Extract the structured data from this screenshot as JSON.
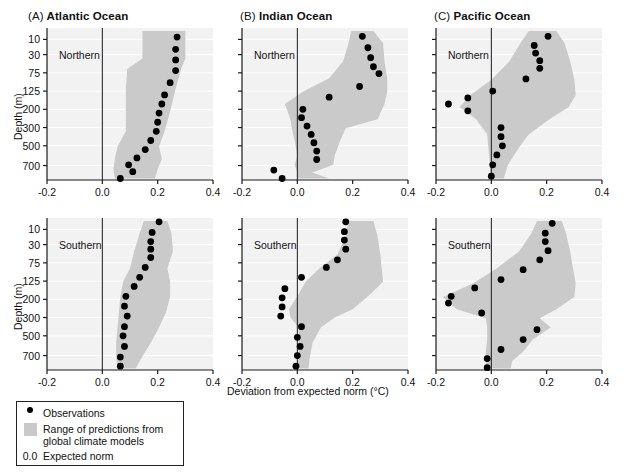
{
  "figure": {
    "xlabel": "Deviation from expected norm (°C)",
    "ylabel": "Depth (m)",
    "xticks": [
      "-0.2",
      "0.0",
      "0.2",
      "0.4"
    ],
    "xtick_values": [
      -0.2,
      0.0,
      0.2,
      0.4
    ],
    "xlim": [
      -0.2,
      0.4
    ],
    "yticks": [
      "10",
      "30",
      "75",
      "125",
      "200",
      "300",
      "500",
      "700"
    ],
    "hemispheres": [
      "Northern",
      "Southern"
    ],
    "band_color": "#cacaca",
    "point_color": "#000000",
    "axis_color": "#1a1a1a",
    "plot_bg": "#f2f2f2"
  },
  "legend": {
    "items": [
      {
        "key": "dot",
        "label": "Observations"
      },
      {
        "key": "swatch",
        "label": "Range of predictions from\nglobal climate models"
      },
      {
        "key": "0.0",
        "label": "Expected norm"
      }
    ]
  },
  "chart_data": {
    "type": "scatter",
    "title": "",
    "xlabel": "Deviation from expected norm (°C)",
    "ylabel": "Depth (m)",
    "xlim": [
      -0.2,
      0.4
    ],
    "xticks": [
      -0.2,
      0.0,
      0.2,
      0.4
    ],
    "depth_categories": [
      10,
      30,
      75,
      125,
      200,
      300,
      500,
      700
    ],
    "depth_tick_labels": [
      "10",
      "30",
      "75",
      "125",
      "200",
      "300",
      "500",
      "700"
    ],
    "grid": "horizontal-faint",
    "legend_position": "below-left",
    "reference_line": 0.0,
    "panels": [
      {
        "id": "A",
        "tag": "(A)",
        "title": "Atlantic Ocean",
        "hemisphere": "Northern",
        "observations": [
          {
            "y": 0.06,
            "x": 0.27
          },
          {
            "y": 0.14,
            "x": 0.265
          },
          {
            "y": 0.21,
            "x": 0.265
          },
          {
            "y": 0.28,
            "x": 0.265
          },
          {
            "y": 0.36,
            "x": 0.245
          },
          {
            "y": 0.44,
            "x": 0.225
          },
          {
            "y": 0.5,
            "x": 0.215
          },
          {
            "y": 0.56,
            "x": 0.205
          },
          {
            "y": 0.62,
            "x": 0.2
          },
          {
            "y": 0.68,
            "x": 0.195
          },
          {
            "y": 0.74,
            "x": 0.175
          },
          {
            "y": 0.8,
            "x": 0.155
          },
          {
            "y": 0.855,
            "x": 0.125
          },
          {
            "y": 0.9,
            "x": 0.095
          },
          {
            "y": 0.945,
            "x": 0.11
          },
          {
            "y": 0.99,
            "x": 0.065
          }
        ],
        "band": [
          {
            "y": 0.02,
            "lo": 0.145,
            "hi": 0.3
          },
          {
            "y": 0.12,
            "lo": 0.145,
            "hi": 0.3
          },
          {
            "y": 0.2,
            "lo": 0.145,
            "hi": 0.3
          },
          {
            "y": 0.27,
            "lo": 0.09,
            "hi": 0.285
          },
          {
            "y": 0.4,
            "lo": 0.085,
            "hi": 0.265
          },
          {
            "y": 0.55,
            "lo": 0.085,
            "hi": 0.245
          },
          {
            "y": 0.68,
            "lo": 0.085,
            "hi": 0.225
          },
          {
            "y": 0.78,
            "lo": 0.055,
            "hi": 0.205
          },
          {
            "y": 0.86,
            "lo": 0.045,
            "hi": 0.215
          },
          {
            "y": 0.93,
            "lo": 0.04,
            "hi": 0.2
          },
          {
            "y": 0.99,
            "lo": 0.045,
            "hi": 0.19
          }
        ]
      },
      {
        "id": "B",
        "tag": "(B)",
        "title": "Indian Ocean",
        "hemisphere": "Northern",
        "observations": [
          {
            "y": 0.055,
            "x": 0.235
          },
          {
            "y": 0.13,
            "x": 0.255
          },
          {
            "y": 0.195,
            "x": 0.265
          },
          {
            "y": 0.255,
            "x": 0.275
          },
          {
            "y": 0.3,
            "x": 0.295
          },
          {
            "y": 0.385,
            "x": 0.225
          },
          {
            "y": 0.455,
            "x": 0.115
          },
          {
            "y": 0.535,
            "x": 0.02
          },
          {
            "y": 0.59,
            "x": 0.015
          },
          {
            "y": 0.645,
            "x": 0.035
          },
          {
            "y": 0.7,
            "x": 0.05
          },
          {
            "y": 0.755,
            "x": 0.06
          },
          {
            "y": 0.81,
            "x": 0.07
          },
          {
            "y": 0.865,
            "x": 0.07
          },
          {
            "y": 0.935,
            "x": -0.085
          },
          {
            "y": 0.99,
            "x": -0.055
          }
        ],
        "band": [
          {
            "y": 0.02,
            "lo": 0.195,
            "hi": 0.275
          },
          {
            "y": 0.1,
            "lo": 0.185,
            "hi": 0.31
          },
          {
            "y": 0.22,
            "lo": 0.165,
            "hi": 0.315
          },
          {
            "y": 0.33,
            "lo": 0.115,
            "hi": 0.325
          },
          {
            "y": 0.42,
            "lo": 0.02,
            "hi": 0.325
          },
          {
            "y": 0.5,
            "lo": -0.045,
            "hi": 0.315
          },
          {
            "y": 0.6,
            "lo": -0.025,
            "hi": 0.29
          },
          {
            "y": 0.66,
            "lo": -0.02,
            "hi": 0.175
          },
          {
            "y": 0.74,
            "lo": -0.01,
            "hi": 0.155
          },
          {
            "y": 0.84,
            "lo": 0.0,
            "hi": 0.135
          },
          {
            "y": 0.9,
            "lo": -0.01,
            "hi": 0.13
          },
          {
            "y": 0.95,
            "lo": 0.0,
            "hi": 0.055
          },
          {
            "y": 0.99,
            "lo": 0.0,
            "hi": 0.115
          }
        ]
      },
      {
        "id": "C",
        "tag": "(C)",
        "title": "Pacific Ocean",
        "hemisphere": "Northern",
        "observations": [
          {
            "y": 0.055,
            "x": 0.205
          },
          {
            "y": 0.115,
            "x": 0.155
          },
          {
            "y": 0.165,
            "x": 0.16
          },
          {
            "y": 0.215,
            "x": 0.175
          },
          {
            "y": 0.265,
            "x": 0.175
          },
          {
            "y": 0.335,
            "x": 0.125
          },
          {
            "y": 0.415,
            "x": 0.005
          },
          {
            "y": 0.46,
            "x": -0.085
          },
          {
            "y": 0.5,
            "x": -0.155
          },
          {
            "y": 0.545,
            "x": -0.085
          },
          {
            "y": 0.655,
            "x": 0.035
          },
          {
            "y": 0.715,
            "x": 0.035
          },
          {
            "y": 0.775,
            "x": 0.04
          },
          {
            "y": 0.835,
            "x": 0.02
          },
          {
            "y": 0.9,
            "x": 0.005
          },
          {
            "y": 0.975,
            "x": 0.0
          }
        ],
        "band": [
          {
            "y": 0.02,
            "lo": 0.135,
            "hi": 0.235
          },
          {
            "y": 0.1,
            "lo": 0.105,
            "hi": 0.265
          },
          {
            "y": 0.22,
            "lo": 0.065,
            "hi": 0.285
          },
          {
            "y": 0.34,
            "lo": 0.0,
            "hi": 0.3
          },
          {
            "y": 0.44,
            "lo": -0.075,
            "hi": 0.305
          },
          {
            "y": 0.52,
            "lo": -0.115,
            "hi": 0.28
          },
          {
            "y": 0.6,
            "lo": -0.055,
            "hi": 0.21
          },
          {
            "y": 0.7,
            "lo": -0.015,
            "hi": 0.135
          },
          {
            "y": 0.8,
            "lo": -0.01,
            "hi": 0.095
          },
          {
            "y": 0.9,
            "lo": -0.005,
            "hi": 0.06
          },
          {
            "y": 0.99,
            "lo": -0.005,
            "hi": 0.045
          }
        ]
      },
      {
        "id": "A2",
        "tag": "(A)",
        "title": "Atlantic Ocean",
        "hemisphere": "Southern",
        "observations": [
          {
            "y": 0.025,
            "x": 0.205
          },
          {
            "y": 0.095,
            "x": 0.18
          },
          {
            "y": 0.155,
            "x": 0.175
          },
          {
            "y": 0.205,
            "x": 0.175
          },
          {
            "y": 0.26,
            "x": 0.175
          },
          {
            "y": 0.325,
            "x": 0.155
          },
          {
            "y": 0.39,
            "x": 0.135
          },
          {
            "y": 0.45,
            "x": 0.115
          },
          {
            "y": 0.515,
            "x": 0.085
          },
          {
            "y": 0.58,
            "x": 0.08
          },
          {
            "y": 0.645,
            "x": 0.09
          },
          {
            "y": 0.715,
            "x": 0.08
          },
          {
            "y": 0.775,
            "x": 0.075
          },
          {
            "y": 0.845,
            "x": 0.08
          },
          {
            "y": 0.915,
            "x": 0.065
          },
          {
            "y": 0.975,
            "x": 0.065
          }
        ],
        "band": [
          {
            "y": 0.02,
            "lo": 0.15,
            "hi": 0.235
          },
          {
            "y": 0.1,
            "lo": 0.135,
            "hi": 0.25
          },
          {
            "y": 0.22,
            "lo": 0.115,
            "hi": 0.255
          },
          {
            "y": 0.33,
            "lo": 0.1,
            "hi": 0.235
          },
          {
            "y": 0.42,
            "lo": 0.075,
            "hi": 0.245
          },
          {
            "y": 0.52,
            "lo": 0.065,
            "hi": 0.245
          },
          {
            "y": 0.62,
            "lo": 0.06,
            "hi": 0.23
          },
          {
            "y": 0.72,
            "lo": 0.055,
            "hi": 0.205
          },
          {
            "y": 0.82,
            "lo": 0.05,
            "hi": 0.175
          },
          {
            "y": 0.91,
            "lo": 0.05,
            "hi": 0.145
          },
          {
            "y": 0.99,
            "lo": 0.055,
            "hi": 0.12
          }
        ]
      },
      {
        "id": "B2",
        "tag": "(B)",
        "title": "Indian Ocean",
        "hemisphere": "Southern",
        "observations": [
          {
            "y": 0.025,
            "x": 0.175
          },
          {
            "y": 0.09,
            "x": 0.17
          },
          {
            "y": 0.145,
            "x": 0.17
          },
          {
            "y": 0.205,
            "x": 0.175
          },
          {
            "y": 0.275,
            "x": 0.145
          },
          {
            "y": 0.325,
            "x": 0.105
          },
          {
            "y": 0.39,
            "x": 0.015
          },
          {
            "y": 0.465,
            "x": -0.045
          },
          {
            "y": 0.525,
            "x": -0.055
          },
          {
            "y": 0.585,
            "x": -0.055
          },
          {
            "y": 0.645,
            "x": -0.06
          },
          {
            "y": 0.715,
            "x": 0.015
          },
          {
            "y": 0.785,
            "x": 0.0
          },
          {
            "y": 0.845,
            "x": 0.01
          },
          {
            "y": 0.905,
            "x": 0.0
          },
          {
            "y": 0.975,
            "x": -0.005
          }
        ],
        "band": [
          {
            "y": 0.02,
            "lo": 0.185,
            "hi": 0.275
          },
          {
            "y": 0.12,
            "lo": 0.175,
            "hi": 0.29
          },
          {
            "y": 0.24,
            "lo": 0.145,
            "hi": 0.3
          },
          {
            "y": 0.33,
            "lo": 0.08,
            "hi": 0.305
          },
          {
            "y": 0.42,
            "lo": 0.03,
            "hi": 0.31
          },
          {
            "y": 0.5,
            "lo": 0.005,
            "hi": 0.265
          },
          {
            "y": 0.6,
            "lo": -0.03,
            "hi": 0.2
          },
          {
            "y": 0.655,
            "lo": -0.025,
            "hi": 0.135
          },
          {
            "y": 0.72,
            "lo": 0.005,
            "hi": 0.085
          },
          {
            "y": 0.82,
            "lo": 0.005,
            "hi": 0.055
          },
          {
            "y": 0.92,
            "lo": 0.005,
            "hi": 0.045
          },
          {
            "y": 0.99,
            "lo": 0.0,
            "hi": 0.04
          }
        ]
      },
      {
        "id": "C2",
        "tag": "(C)",
        "title": "Pacific Ocean",
        "hemisphere": "Southern",
        "observations": [
          {
            "y": 0.035,
            "x": 0.22
          },
          {
            "y": 0.1,
            "x": 0.195
          },
          {
            "y": 0.155,
            "x": 0.195
          },
          {
            "y": 0.215,
            "x": 0.205
          },
          {
            "y": 0.275,
            "x": 0.175
          },
          {
            "y": 0.34,
            "x": 0.115
          },
          {
            "y": 0.405,
            "x": 0.035
          },
          {
            "y": 0.46,
            "x": -0.06
          },
          {
            "y": 0.515,
            "x": -0.145
          },
          {
            "y": 0.56,
            "x": -0.155
          },
          {
            "y": 0.625,
            "x": -0.035
          },
          {
            "y": 0.735,
            "x": 0.165
          },
          {
            "y": 0.8,
            "x": 0.115
          },
          {
            "y": 0.865,
            "x": 0.035
          },
          {
            "y": 0.925,
            "x": -0.015
          },
          {
            "y": 0.985,
            "x": -0.015
          }
        ],
        "band": [
          {
            "y": 0.02,
            "lo": 0.165,
            "hi": 0.255
          },
          {
            "y": 0.1,
            "lo": 0.145,
            "hi": 0.27
          },
          {
            "y": 0.22,
            "lo": 0.1,
            "hi": 0.285
          },
          {
            "y": 0.33,
            "lo": 0.02,
            "hi": 0.295
          },
          {
            "y": 0.43,
            "lo": -0.065,
            "hi": 0.305
          },
          {
            "y": 0.52,
            "lo": -0.175,
            "hi": 0.3
          },
          {
            "y": 0.6,
            "lo": -0.125,
            "hi": 0.235
          },
          {
            "y": 0.66,
            "lo": -0.02,
            "hi": 0.175
          },
          {
            "y": 0.72,
            "lo": -0.015,
            "hi": 0.215
          },
          {
            "y": 0.8,
            "lo": -0.015,
            "hi": 0.15
          },
          {
            "y": 0.88,
            "lo": -0.02,
            "hi": 0.115
          },
          {
            "y": 0.94,
            "lo": -0.02,
            "hi": 0.075
          },
          {
            "y": 0.99,
            "lo": -0.02,
            "hi": 0.07
          }
        ]
      }
    ]
  }
}
